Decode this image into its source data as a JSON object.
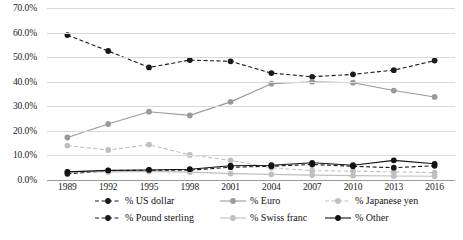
{
  "chart_data": {
    "type": "line",
    "title": "",
    "subtitle": "",
    "xlabel": "",
    "ylabel": "",
    "x": [
      "1989",
      "1992",
      "1995",
      "1998",
      "2001",
      "2004",
      "2007",
      "2010",
      "2013",
      "2016"
    ],
    "categories": [
      "1989",
      "1992",
      "1995",
      "1998",
      "2001",
      "2004",
      "2007",
      "2010",
      "2013",
      "2016"
    ],
    "ylim": [
      0,
      70
    ],
    "ytick_labels": [
      "0.0%",
      "10.0%",
      "20.0%",
      "30.0%",
      "40.0%",
      "50.0%",
      "60.0%",
      "70.0%"
    ],
    "ytick_values": [
      0,
      10,
      20,
      30,
      40,
      50,
      60,
      70
    ],
    "grid": true,
    "legend_position": "bottom",
    "series": [
      {
        "name": "% US dollar",
        "color": "#1a1a1a",
        "style": "dashed",
        "marker": "circle",
        "values": [
          59.0,
          52.5,
          45.8,
          48.8,
          48.3,
          43.5,
          42.0,
          43.0,
          44.7,
          48.6
        ]
      },
      {
        "name": "% Euro",
        "color": "#9a9a9a",
        "style": "solid",
        "marker": "circle",
        "values": [
          17.3,
          22.8,
          27.8,
          26.3,
          31.8,
          39.2,
          40.0,
          39.6,
          36.4,
          33.8
        ]
      },
      {
        "name": "% Japanese yen",
        "color": "#bfbfbf",
        "style": "dashed",
        "marker": "circle",
        "values": [
          14.0,
          12.2,
          14.4,
          10.2,
          8.0,
          5.0,
          3.8,
          3.6,
          3.3,
          3.0
        ]
      },
      {
        "name": "% Pound sterling",
        "color": "#1a1a1a",
        "style": "dashed",
        "marker": "circle",
        "values": [
          2.5,
          3.8,
          4.0,
          4.0,
          5.2,
          5.6,
          6.3,
          5.6,
          5.0,
          5.8
        ]
      },
      {
        "name": "% Swiss franc",
        "color": "#bfbfbf",
        "style": "solid",
        "marker": "circle",
        "values": [
          3.4,
          3.3,
          3.5,
          3.2,
          2.6,
          2.3,
          2.0,
          1.8,
          1.6,
          1.5
        ]
      },
      {
        "name": "% Other",
        "color": "#111111",
        "style": "solid",
        "marker": "circle",
        "values": [
          3.3,
          3.9,
          4.1,
          4.4,
          5.8,
          6.0,
          7.0,
          6.0,
          8.0,
          6.6
        ]
      }
    ]
  }
}
